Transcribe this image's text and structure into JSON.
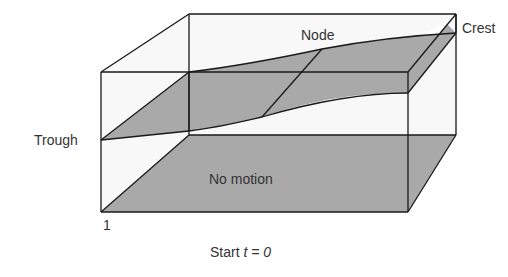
{
  "diagram": {
    "type": "standing-wave-3d-illustration",
    "labels": {
      "node": "Node",
      "crest": "Crest",
      "trough": "Trough",
      "no_motion": "No motion",
      "corner_index": "1",
      "caption_prefix": "Start ",
      "caption_var": "t = 0"
    },
    "colors": {
      "surface_fill": "#a9a9a9",
      "box_fill": "#f7f7f7",
      "stroke": "#1a1a1a",
      "text": "#333333"
    }
  }
}
